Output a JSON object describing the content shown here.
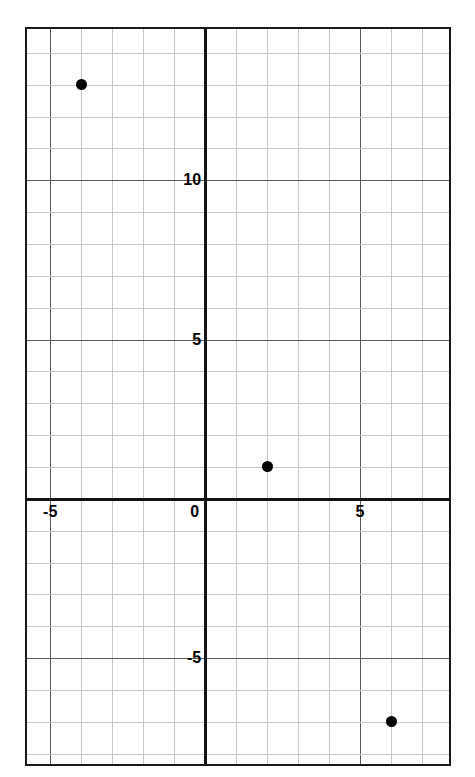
{
  "chart_data": {
    "type": "scatter",
    "title": "",
    "xlabel": "",
    "ylabel": "",
    "xlim": [
      -5.75,
      8.0
    ],
    "ylim": [
      -8.45,
      14.75
    ],
    "grid": true,
    "grid_minor_step": 1,
    "grid_major_step": 5,
    "legend": "none",
    "x_tick_labels": [
      "-5",
      "0",
      "5"
    ],
    "x_tick_values": [
      -5,
      0,
      5
    ],
    "y_tick_labels": [
      "10",
      "5",
      "-5"
    ],
    "y_tick_values": [
      10,
      5,
      -5
    ],
    "points": [
      {
        "label": "point-a",
        "x": -4,
        "y": 13
      },
      {
        "label": "point-b",
        "x": 2,
        "y": 1
      },
      {
        "label": "point-c",
        "x": 6,
        "y": -7
      }
    ],
    "point_color": "#000000",
    "axis_color": "#141414",
    "major_grid_color": "#5a5a5a",
    "minor_grid_color": "#c8c8c8"
  },
  "axis_labels": {
    "y_ten": "10",
    "y_five": "5",
    "y_neg_five": "-5",
    "x_neg_five": "-5",
    "x_zero": "0",
    "x_five": "5"
  }
}
